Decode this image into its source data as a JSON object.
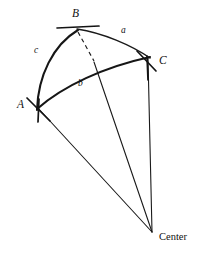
{
  "figure": {
    "background_color": "#ffffff",
    "stroke_color": "#1a1a1a",
    "width": 202,
    "height": 256,
    "vertices": [
      {
        "id": "A",
        "label": "A",
        "x": 38,
        "y": 108,
        "label_x": 17,
        "label_y": 104
      },
      {
        "id": "B",
        "label": "B",
        "x": 77,
        "y": 29,
        "label_x": 72,
        "label_y": 14
      },
      {
        "id": "C",
        "label": "C",
        "x": 148,
        "y": 58,
        "label_x": 158,
        "label_y": 60
      }
    ],
    "sides": [
      {
        "id": "a",
        "label": "a",
        "label_x": 123,
        "label_y": 30,
        "between": "B-C"
      },
      {
        "id": "b",
        "label": "b",
        "label_x": 80,
        "label_y": 82,
        "between": "A-C"
      },
      {
        "id": "c",
        "label": "c",
        "label_x": 36,
        "label_y": 50,
        "between": "A-B"
      }
    ],
    "center": {
      "id": "Center",
      "label": "Center",
      "x": 152,
      "y": 232,
      "label_x": 158,
      "label_y": 240
    },
    "arcs": [
      {
        "id": "arc-AB-thick",
        "from": "A",
        "to": "B",
        "style": "thick",
        "note": "great circle arc side c"
      },
      {
        "id": "arc-BC-thin",
        "from": "B",
        "to": "C",
        "style": "thin",
        "note": "great circle arc side a"
      },
      {
        "id": "arc-AC-thick",
        "from": "A",
        "to": "C",
        "style": "thick",
        "note": "great circle arc side b"
      }
    ],
    "radii": [
      {
        "id": "radius-A-center",
        "from": "A",
        "to": "Center"
      },
      {
        "id": "radius-C-center",
        "from": "C",
        "to": "Center"
      },
      {
        "id": "radius-P-center",
        "from": "arc-intersection",
        "to": "Center"
      }
    ],
    "dashed": {
      "id": "dashed-B-to-arc",
      "from": "B",
      "to_x": 94,
      "to_y": 62,
      "note": "dashed segment from B down to intersection with arc b"
    },
    "tick_marks": [
      {
        "id": "tick-A",
        "at": "A"
      },
      {
        "id": "tick-B",
        "at": "B"
      },
      {
        "id": "tick-C",
        "at": "C"
      }
    ]
  }
}
